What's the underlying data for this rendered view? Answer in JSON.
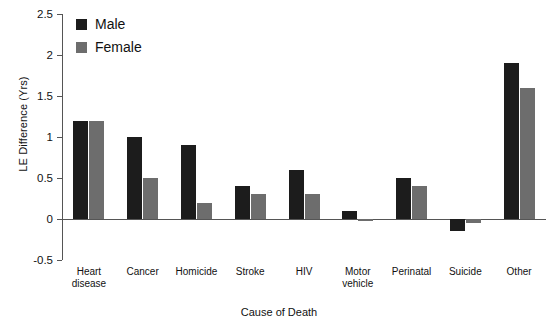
{
  "chart_data": {
    "type": "bar",
    "title": "",
    "subtitle": "",
    "xlabel": "Cause of Death",
    "ylabel": "LE Difference (Yrs)",
    "ylim": [
      -0.5,
      2.5
    ],
    "ytick_values": [
      2.5,
      2,
      1.5,
      1,
      0.5,
      0,
      -0.5
    ],
    "ytick_labels": [
      "2.5",
      "2",
      "1.5",
      "1",
      "0.5",
      "0",
      "-0.5"
    ],
    "grid": false,
    "legend_position": "top-left",
    "categories": [
      "Heart disease",
      "Cancer",
      "Homicide",
      "Stroke",
      "HIV",
      "Motor vehicle",
      "Perinatal",
      "Suicide",
      "Other"
    ],
    "category_lines": [
      [
        "Heart",
        "disease"
      ],
      [
        "Cancer"
      ],
      [
        "Homicide"
      ],
      [
        "Stroke"
      ],
      [
        "HIV"
      ],
      [
        "Motor",
        "vehicle"
      ],
      [
        "Perinatal"
      ],
      [
        "Suicide"
      ],
      [
        "Other"
      ]
    ],
    "series": [
      {
        "name": "Male",
        "color": "#1c1c1c",
        "values": [
          1.2,
          1.0,
          0.9,
          0.4,
          0.6,
          0.1,
          0.5,
          -0.15,
          1.9
        ]
      },
      {
        "name": "Female",
        "color": "#6d6d6d",
        "values": [
          1.2,
          0.5,
          0.2,
          0.3,
          0.3,
          -0.02,
          0.4,
          -0.05,
          1.6
        ]
      }
    ]
  },
  "legend": {
    "items": [
      {
        "label": "Male",
        "swatch": "male"
      },
      {
        "label": "Female",
        "swatch": "female"
      }
    ]
  }
}
